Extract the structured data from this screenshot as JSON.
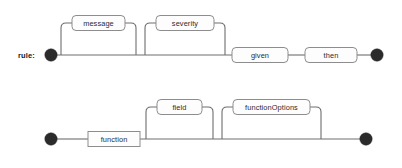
{
  "page": {
    "background_color": "#ffffff",
    "line_color": "#6e6e6e",
    "node_color": "#2b2b2b",
    "box_stroke_color": "#8d8d8d",
    "box_fill_color": "#fdfdfd",
    "text_color": "#2b2b2b"
  },
  "diagrams": [
    {
      "id": "rule",
      "label": "rule:",
      "nodes": [
        {
          "name": "message",
          "shape": "rounded",
          "optional": true,
          "branch": "above"
        },
        {
          "name": "severity",
          "shape": "rounded",
          "optional": true,
          "branch": "above"
        },
        {
          "name": "given",
          "shape": "rounded",
          "optional": false,
          "branch": "main"
        },
        {
          "name": "then",
          "shape": "rounded",
          "optional": false,
          "branch": "main"
        }
      ]
    },
    {
      "id": "then",
      "label": "then:",
      "nodes": [
        {
          "name": "function",
          "shape": "rect",
          "optional": false,
          "branch": "main"
        },
        {
          "name": "field",
          "shape": "rounded",
          "optional": true,
          "branch": "above"
        },
        {
          "name": "functionOptions",
          "shape": "rounded",
          "optional": true,
          "branch": "above"
        }
      ]
    }
  ]
}
